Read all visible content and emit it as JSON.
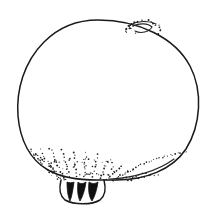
{
  "figure": {
    "domain_kind": "natural-image",
    "background_color": "#ffffff",
    "ink_color": "#1a1a1a",
    "canvas": {
      "width": 214,
      "height": 214
    },
    "caption": "",
    "label_text": "",
    "parts": [
      {
        "name": "body-outline",
        "label": "body",
        "description": "large rounded ovoid body outline"
      },
      {
        "name": "apical-scar",
        "label": "scar",
        "description": "small crescent mark at upper right"
      },
      {
        "name": "scar-stipple",
        "label": "stipple",
        "description": "arc of dots around the crescent mark"
      },
      {
        "name": "basal-bristles",
        "label": "bristles",
        "description": "radiating stippled bristles at base"
      },
      {
        "name": "claw-cluster",
        "label": "claws",
        "description": "three dark claw-like spikes at base"
      },
      {
        "name": "basal-pouch",
        "label": "pouch",
        "description": "pouch outline enclosing the claws"
      }
    ],
    "geometry": {
      "body_outline_path": "M 98 20 C 139 20, 175 38, 190 66 C 203 91, 201 125, 186 149 C 172 170, 145 180, 116 180 C 108 180, 102 180, 97 180 C 80 180, 62 178, 48 170 C 30 160, 20 140, 18 116 C 16 90, 24 62, 44 42 C 59 27, 78 20, 98 20 Z",
      "body_bottom_right_edge_path": "M 110 179 C 133 178, 158 171, 174 159",
      "scar_crescent_path": "M 133 26 C 139 23, 148 23, 152 27 C 149 32, 141 34, 135 31",
      "scar_upper_line_path": "M 130 25 C 137 21, 149 20, 156 24",
      "pouch_path": "M 61 180 C 59 188, 60 196, 65 200 C 74 205, 92 205, 100 200 C 105 196, 106 188, 104 180",
      "claw_paths": [
        "M 67 182 C 67 190, 68 197, 70 201 C 72 196, 73 189, 74 182 C 72 183, 69 183, 67 182 Z",
        "M 78 182 C 77 190, 78 197, 80 201 C 83 196, 85 189, 86 182 C 83 184, 80 184, 78 182 Z",
        "M 89 182 C 88 190, 89 197, 92 201 C 95 196, 97 189, 98 182 C 95 184, 92 184, 89 182 Z"
      ],
      "bristle_streaks": [
        {
          "x1": 58,
          "y1": 178,
          "x2": 40,
          "y2": 150
        },
        {
          "x1": 63,
          "y1": 177,
          "x2": 50,
          "y2": 148
        },
        {
          "x1": 69,
          "y1": 176,
          "x2": 62,
          "y2": 150
        },
        {
          "x1": 76,
          "y1": 176,
          "x2": 74,
          "y2": 152
        },
        {
          "x1": 84,
          "y1": 176,
          "x2": 86,
          "y2": 153
        },
        {
          "x1": 92,
          "y1": 177,
          "x2": 98,
          "y2": 155
        },
        {
          "x1": 100,
          "y1": 178,
          "x2": 110,
          "y2": 160
        },
        {
          "x1": 107,
          "y1": 179,
          "x2": 122,
          "y2": 166
        },
        {
          "x1": 113,
          "y1": 180,
          "x2": 132,
          "y2": 170
        },
        {
          "x1": 52,
          "y1": 174,
          "x2": 33,
          "y2": 155
        },
        {
          "x1": 120,
          "y1": 180,
          "x2": 146,
          "y2": 173
        },
        {
          "x1": 128,
          "y1": 180,
          "x2": 158,
          "y2": 174
        }
      ],
      "bottom_right_dot_arc": {
        "from_x": 120,
        "from_y": 176,
        "to_x": 186,
        "to_y": 152,
        "count": 26
      },
      "scar_dot_arc": {
        "cx": 143,
        "cy": 30,
        "rx": 17,
        "ry": 11,
        "count": 20,
        "start_deg": 160,
        "end_deg": 380
      }
    }
  }
}
